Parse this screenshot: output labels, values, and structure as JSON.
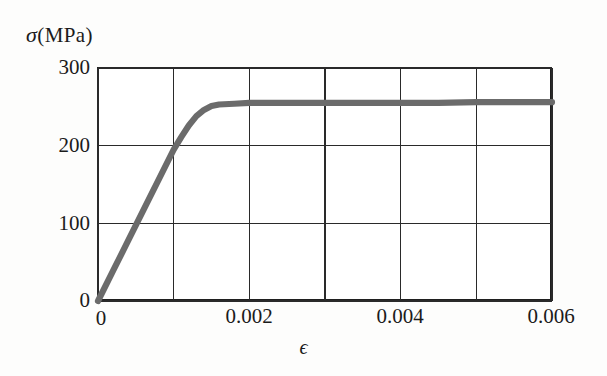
{
  "figure": {
    "background_color": "#fdfdfc",
    "plot_background_color": "#ffffff",
    "frame_color": "#1f1f1f",
    "grid_color": "#2a2a2a",
    "curve_color": "#6b6b6b"
  },
  "axes": {
    "ylabel_symbol": "σ",
    "ylabel_unit": "(MPa)",
    "ylabel_full": "σ (MPa)",
    "xlabel": "ϵ",
    "y_ticklabels": [
      "300",
      "200",
      "100",
      "0"
    ],
    "x_ticklabels": [
      "0",
      "0.002",
      "0.004",
      "0.006"
    ]
  },
  "chart_data": {
    "type": "line",
    "title": "",
    "subtitle": "",
    "xlabel": "ϵ",
    "ylabel": "σ (MPa)",
    "xlim": [
      0,
      0.006
    ],
    "ylim": [
      0,
      300
    ],
    "xticks": [
      0,
      0.002,
      0.004,
      0.006
    ],
    "yticks": [
      0,
      100,
      200,
      300
    ],
    "x_gridlines": [
      0,
      0.001,
      0.002,
      0.003,
      0.004,
      0.005,
      0.006
    ],
    "y_gridlines": [
      0,
      100,
      200,
      300
    ],
    "grid": true,
    "legend": false,
    "annotations": [],
    "series": [
      {
        "name": "stress-strain curve",
        "color": "#6b6b6b",
        "linewidth": 6,
        "x": [
          0.0,
          0.0002,
          0.0004,
          0.0006,
          0.0008,
          0.001,
          0.0011,
          0.0012,
          0.0013,
          0.0014,
          0.0015,
          0.0016,
          0.0018,
          0.002,
          0.0025,
          0.003,
          0.0035,
          0.004,
          0.0045,
          0.005,
          0.0055,
          0.006
        ],
        "y": [
          0,
          39,
          78,
          117,
          156,
          195,
          211,
          226,
          238,
          246,
          251,
          253,
          254,
          255,
          255,
          255,
          255,
          255,
          255,
          256,
          256,
          256
        ]
      }
    ]
  }
}
